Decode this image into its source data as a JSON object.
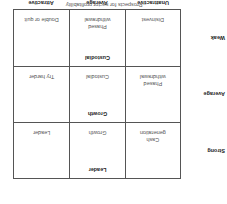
{
  "diagram": {
    "y_axis_title": "Company's competitive capability",
    "x_axis_title": "Prospects for sector profitability",
    "row_labels": [
      "Strong",
      "Average",
      "Weak"
    ],
    "col_labels": [
      "Unattractive",
      "Average",
      "Attractive"
    ],
    "cells": [
      [
        {
          "top": "",
          "bottom": "Cash\ngeneration"
        },
        {
          "top": "Leader",
          "bottom": "Growth"
        },
        {
          "top": "",
          "bottom": "Leader"
        }
      ],
      [
        {
          "top": "",
          "bottom": "Phased\nwithdrawal"
        },
        {
          "top": "Growth",
          "bottom": "Custodial"
        },
        {
          "top": "",
          "bottom": "Try harder"
        }
      ],
      [
        {
          "top": "",
          "bottom": "Disinvest"
        },
        {
          "top": "Custodial",
          "bottom": "Phased\nwithdrawal"
        },
        {
          "top": "",
          "bottom": "Double or quit"
        }
      ]
    ],
    "line_color": "#555555",
    "orientation": "rotated 180°"
  }
}
